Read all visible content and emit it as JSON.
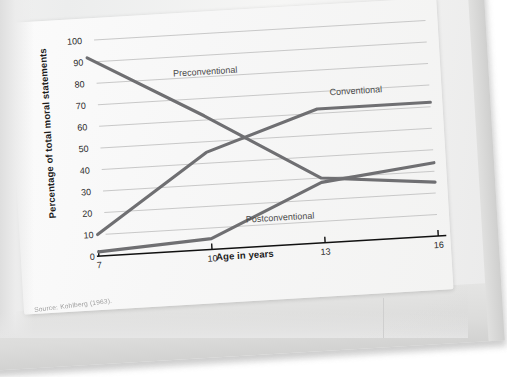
{
  "figure": {
    "source_caption": "Source: Kohlberg (1963).",
    "top_cut_text": "Fig."
  },
  "chart_data": {
    "type": "line",
    "title": "",
    "xlabel": "Age in years",
    "ylabel": "Percentage of total moral statements",
    "x": [
      7,
      10,
      13,
      16
    ],
    "xtick_labels": [
      "7",
      "10",
      "13",
      "16"
    ],
    "ytick_labels": [
      "0",
      "10",
      "20",
      "30",
      "40",
      "50",
      "60",
      "70",
      "80",
      "90",
      "100"
    ],
    "yticks": [
      0,
      10,
      20,
      30,
      40,
      50,
      60,
      70,
      80,
      90,
      100
    ],
    "ylim": [
      0,
      100
    ],
    "xlim": [
      7,
      16
    ],
    "grid": true,
    "legend": "inline-labels",
    "series": [
      {
        "name": "Preconventional",
        "values": [
          92,
          62,
          30,
          25
        ],
        "color": "#6f6f72",
        "label_x": 10.1,
        "label_y": 81
      },
      {
        "name": "Conventional",
        "values": [
          10,
          45,
          62,
          62
        ],
        "color": "#6f6f72",
        "label_x": 14.05,
        "label_y": 68
      },
      {
        "name": "Postconventional",
        "values": [
          2,
          5,
          28,
          34
        ],
        "color": "#6f6f72",
        "label_x": 11.85,
        "label_y": 11.5
      }
    ],
    "axis_color": "#111111",
    "grid_color": "#c8c8c8"
  }
}
